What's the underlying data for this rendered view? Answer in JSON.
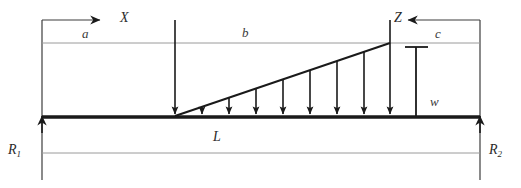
{
  "diagram": {
    "type": "engineering-free-body-diagram",
    "canvas": {
      "width": 521,
      "height": 188,
      "background": "#ffffff"
    },
    "colors": {
      "beam": "#1a1a1a",
      "load_outline": "#1a1a1a",
      "arrow": "#1a1a1a",
      "dimension_line": "#8c8c8c",
      "extension_line": "#3d3d3d",
      "label_text": "#3a3a3a"
    },
    "labels": {
      "x_axis": "X",
      "z_axis": "Z",
      "dim_a": "a",
      "dim_b": "b",
      "dim_c": "c",
      "dim_L": "L",
      "load_intensity": "w",
      "reaction_left": "R",
      "reaction_left_sub": "1",
      "reaction_right": "R",
      "reaction_right_sub": "2"
    },
    "geometry": {
      "beam_left_x": 42,
      "beam_right_x": 480,
      "beam_y": 117,
      "load_start_x": 175,
      "load_end_x": 390,
      "load_top_y": 43,
      "dim_top_y": 20,
      "ref_line_y": 43,
      "dim_bottom_y": 153,
      "load_arrow_count": 7
    },
    "annotations": {
      "x_arrow_direction": "right",
      "z_arrow_direction": "left",
      "reaction_direction": "up",
      "load_direction": "down",
      "load_shape": "triangular-increasing-left-to-right"
    }
  }
}
